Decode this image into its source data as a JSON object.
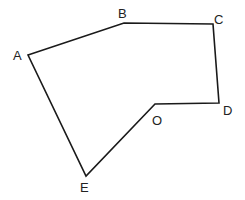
{
  "diagram": {
    "type": "polygon",
    "stroke_color": "#1a1a1a",
    "label_color": "#222222",
    "vertices": [
      {
        "label": "A",
        "x": 28,
        "y": 55,
        "lx": 13,
        "ly": 60
      },
      {
        "label": "B",
        "x": 124,
        "y": 23,
        "lx": 118,
        "ly": 18
      },
      {
        "label": "C",
        "x": 213,
        "y": 24,
        "lx": 214,
        "ly": 24
      },
      {
        "label": "D",
        "x": 219,
        "y": 103,
        "lx": 223,
        "ly": 115
      },
      {
        "label": "O",
        "x": 155,
        "y": 104,
        "lx": 152,
        "ly": 125
      },
      {
        "label": "E",
        "x": 86,
        "y": 176,
        "lx": 80,
        "ly": 192
      }
    ]
  }
}
